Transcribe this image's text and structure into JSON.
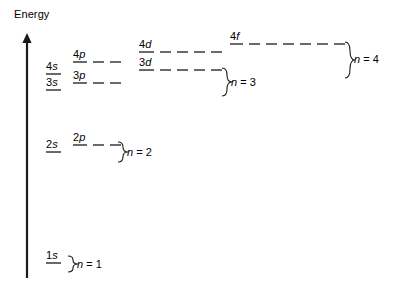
{
  "diagram": {
    "background": "#ffffff",
    "ink": "#1a1a1a",
    "width": 400,
    "height": 285
  },
  "axis": {
    "label": "Energy",
    "direction": "up",
    "x": 27,
    "y_top": 33,
    "y_bottom": 278,
    "label_x": 14,
    "label_y": 8
  },
  "orbitals": [
    {
      "id": "1s",
      "n": "1",
      "l": "s",
      "x": 46,
      "y": 263,
      "label_w": 15,
      "dashes": 0,
      "dash_len": 0,
      "dash_gap": 0
    },
    {
      "id": "2s",
      "n": "2",
      "l": "s",
      "x": 46,
      "y": 152,
      "label_w": 15,
      "dashes": 0,
      "dash_len": 0,
      "dash_gap": 0
    },
    {
      "id": "2p",
      "n": "2",
      "l": "p",
      "x": 73,
      "y": 145,
      "label_w": 14,
      "dashes": 2,
      "dash_len": 11,
      "dash_gap": 6
    },
    {
      "id": "3s",
      "n": "3",
      "l": "s",
      "x": 46,
      "y": 90,
      "label_w": 15,
      "dashes": 0,
      "dash_len": 0,
      "dash_gap": 0
    },
    {
      "id": "3p",
      "n": "3",
      "l": "p",
      "x": 73,
      "y": 83,
      "label_w": 14,
      "dashes": 2,
      "dash_len": 11,
      "dash_gap": 6
    },
    {
      "id": "3d",
      "n": "3",
      "l": "d",
      "x": 139,
      "y": 70,
      "label_w": 15,
      "dashes": 4,
      "dash_len": 11,
      "dash_gap": 6
    },
    {
      "id": "4s",
      "n": "4",
      "l": "s",
      "x": 46,
      "y": 74,
      "label_w": 15,
      "dashes": 0,
      "dash_len": 0,
      "dash_gap": 0
    },
    {
      "id": "4p",
      "n": "4",
      "l": "p",
      "x": 73,
      "y": 62,
      "label_w": 14,
      "dashes": 2,
      "dash_len": 11,
      "dash_gap": 6
    },
    {
      "id": "4d",
      "n": "4",
      "l": "d",
      "x": 139,
      "y": 52,
      "label_w": 15,
      "dashes": 4,
      "dash_len": 11,
      "dash_gap": 6
    },
    {
      "id": "4f",
      "n": "4",
      "l": "f",
      "x": 230,
      "y": 44,
      "label_w": 13,
      "dashes": 6,
      "dash_len": 11,
      "dash_gap": 6
    }
  ],
  "shells": [
    {
      "id": "n1",
      "label_n": "n",
      "label_eq": " = 1",
      "brace_x": 68,
      "brace_top": 256,
      "brace_bottom": 272,
      "text_x": 77,
      "text_y": 258
    },
    {
      "id": "n2",
      "label_n": "n",
      "label_eq": " = 2",
      "brace_x": 118,
      "brace_top": 142,
      "brace_bottom": 162,
      "text_x": 127,
      "text_y": 146
    },
    {
      "id": "n3",
      "label_n": "n",
      "label_eq": " = 3",
      "brace_x": 222,
      "brace_top": 68,
      "brace_bottom": 96,
      "text_x": 231,
      "text_y": 76
    },
    {
      "id": "n4",
      "label_n": "n",
      "label_eq": " = 4",
      "brace_x": 345,
      "brace_top": 42,
      "brace_bottom": 78,
      "text_x": 354,
      "text_y": 53
    }
  ]
}
